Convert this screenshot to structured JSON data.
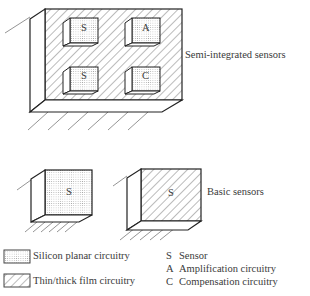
{
  "diagram": {
    "groups": [
      {
        "label": "Semi-integrated sensors",
        "substrate": "Thin/thick film circuitry",
        "chips": [
          {
            "letter": "S",
            "type": "Silicon planar circuitry"
          },
          {
            "letter": "A",
            "type": "Silicon planar circuitry"
          },
          {
            "letter": "S",
            "type": "Silicon planar circuitry"
          },
          {
            "letter": "C",
            "type": "Silicon planar circuitry"
          }
        ]
      },
      {
        "label": "Basic sensors",
        "blocks": [
          {
            "letter": "S",
            "type": "Silicon planar circuitry"
          },
          {
            "letter": "S",
            "type": "Thin/thick film circuitry"
          }
        ]
      }
    ],
    "legend": {
      "patterns": [
        {
          "pattern": "dotted",
          "label": "Silicon planar circuitry"
        },
        {
          "pattern": "hatched",
          "label": "Thin/thick film circuitry"
        }
      ],
      "key": [
        {
          "letter": "S",
          "label": "Sensor"
        },
        {
          "letter": "A",
          "label": "Amplification circuitry"
        },
        {
          "letter": "C",
          "label": "Compensation circuitry"
        }
      ]
    },
    "colors": {
      "line": "#222222",
      "dots": "#9a9a9a",
      "hatch": "#555555"
    }
  }
}
